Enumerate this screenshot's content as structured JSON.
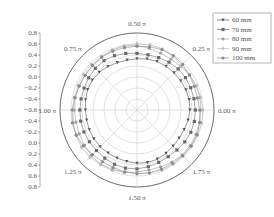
{
  "chart_data": {
    "type": "polar-scatter-line",
    "title": "",
    "ylabel": "",
    "ylabel_note": "vertical label present at left but characters could not be resolved at this resolution",
    "radial_axis": {
      "ticks_top": [
        "0.8",
        "0.6",
        "0.4",
        "0.2",
        "0.0",
        "−0.2",
        "−0.4",
        "−0.6"
      ],
      "ticks_bottom": [
        "−0.4",
        "−0.2",
        "0.0",
        "0.2",
        "0.4",
        "0.6",
        "0.8"
      ],
      "center_value": -0.6,
      "outer_value": 0.8,
      "range": [
        -0.6,
        0.8
      ]
    },
    "angular_axis": {
      "labels": [
        "0.00 π",
        "0.25 π",
        "0.50 π",
        "0.75 π",
        "1.00 π",
        "1.25 π",
        "1.50 π",
        "1.75 π"
      ],
      "angles_pi": [
        0,
        0.25,
        0.5,
        0.75,
        1.0,
        1.25,
        1.5,
        1.75
      ]
    },
    "grid": true,
    "legend_position": "top-right",
    "num_points_per_series": 32,
    "series": [
      {
        "name": "60 mm",
        "marker": "triangle-down",
        "color": "#555555",
        "mean_value": 0.35,
        "variation": 0.03
      },
      {
        "name": "70 mm",
        "marker": "square",
        "color": "#6a6a6a",
        "mean_value": 0.45,
        "variation": 0.03
      },
      {
        "name": "80 mm",
        "marker": "circle",
        "color": "#a0a0a0",
        "mean_value": 0.55,
        "variation": 0.04
      },
      {
        "name": "90 mm",
        "marker": "diamond",
        "color": "#bdbdbd",
        "mean_value": 0.58,
        "variation": 0.04
      },
      {
        "name": "100 mm",
        "marker": "hexagon",
        "color": "#8c8c8c",
        "mean_value": 0.56,
        "variation": 0.04
      }
    ]
  },
  "legend": {
    "items": [
      "60 mm",
      "70 mm",
      "80 mm",
      "90 mm",
      "100 mm"
    ]
  }
}
